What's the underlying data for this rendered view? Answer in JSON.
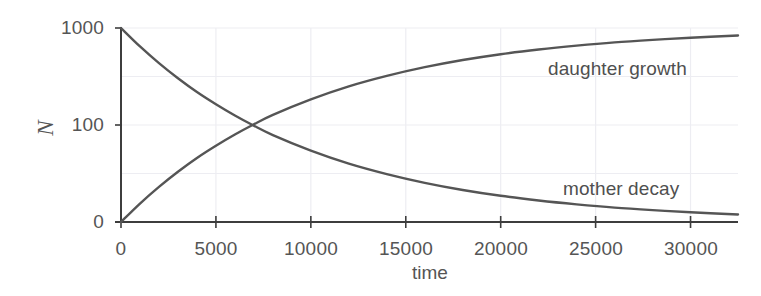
{
  "chart_data": {
    "type": "line",
    "title": "",
    "xlabel": "time",
    "ylabel": "N",
    "xlim": [
      0,
      32500
    ],
    "ylim": [
      0,
      1000
    ],
    "grid": true,
    "legend_position": "inline-annotations",
    "xticks": [
      0,
      5000,
      10000,
      15000,
      20000,
      25000,
      30000
    ],
    "xticklabels": [
      "0",
      "5000",
      "10000",
      "15000",
      "20000",
      "25000",
      "30000"
    ],
    "yticks": [
      0,
      100,
      1000
    ],
    "yticklabels": [
      "0",
      "100",
      "1000"
    ],
    "ytick_positions_fraction": [
      0.0,
      0.5,
      1.0
    ],
    "x": [
      0,
      1000,
      2000,
      3000,
      4000,
      5000,
      6000,
      6930,
      8000,
      10000,
      12000,
      14000,
      16000,
      18000,
      20000,
      22000,
      24000,
      26000,
      28000,
      30000,
      32500
    ],
    "series": [
      {
        "name": "mother decay",
        "annotation": "mother decay",
        "color": "#555555",
        "values": [
          1000,
          905,
          819,
          741,
          670,
          607,
          549,
          500,
          448,
          368,
          301,
          247,
          202,
          165,
          135,
          111,
          91,
          74,
          61,
          50,
          39
        ]
      },
      {
        "name": "daughter growth",
        "annotation": "daughter growth",
        "color": "#555555",
        "values": [
          0,
          95,
          181,
          259,
          330,
          393,
          451,
          500,
          552,
          632,
          699,
          753,
          798,
          835,
          865,
          889,
          909,
          926,
          939,
          950,
          961
        ]
      }
    ],
    "model": {
      "initial_amount": 1000,
      "decay_constant": 0.0001,
      "half_life": 6931
    }
  },
  "annotations": {
    "daughter": "daughter growth",
    "mother": "mother decay"
  },
  "axes": {
    "x_title": "time",
    "y_title": "N"
  },
  "colors": {
    "line": "#555555",
    "axis": "#3d3d3d",
    "grid": "#ededf2",
    "text": "#555555",
    "background": "#ffffff"
  }
}
